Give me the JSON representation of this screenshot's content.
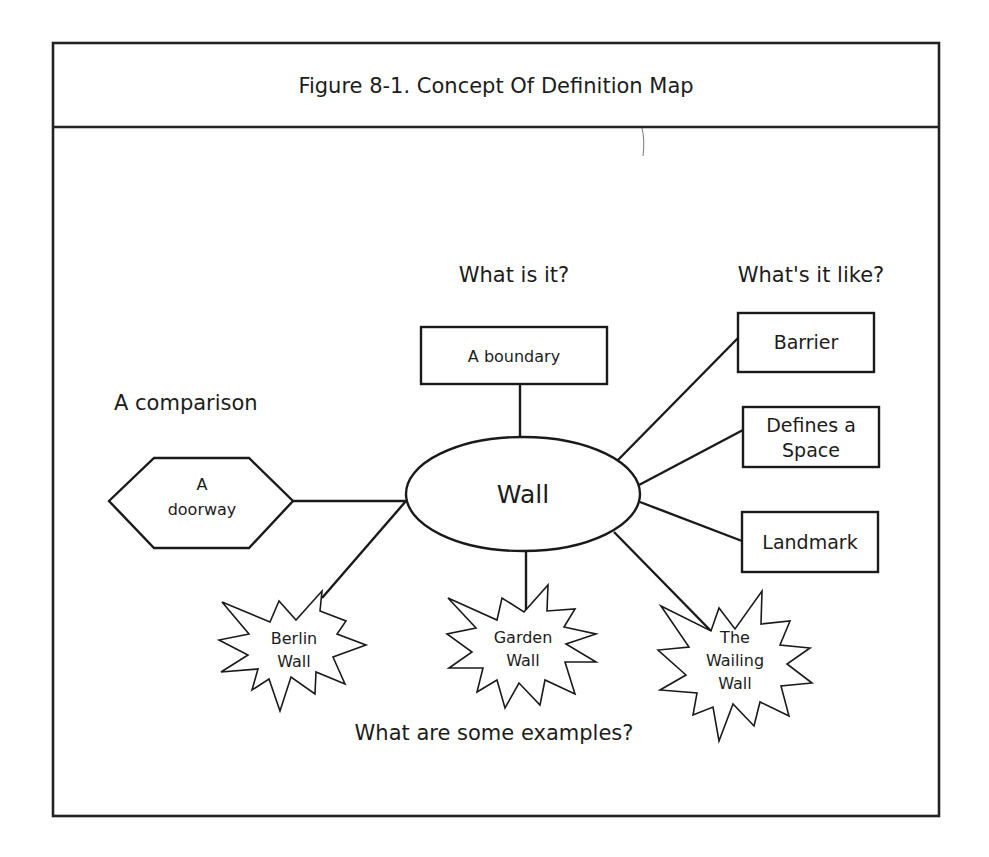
{
  "figure": {
    "title": "Figure 8-1. Concept Of Definition Map"
  },
  "colors": {
    "stroke": "#1a1a1a",
    "background": "#ffffff",
    "text": "#1c1c1c"
  },
  "concept": {
    "label": "Wall"
  },
  "questions": {
    "what_is_it": "What is it?",
    "whats_it_like": "What's it like?",
    "comparison": "A comparison",
    "examples": "What are some examples?"
  },
  "definition": {
    "label": "A boundary"
  },
  "properties": [
    {
      "lines": [
        "Barrier"
      ]
    },
    {
      "lines": [
        "Defines a",
        "Space"
      ]
    },
    {
      "lines": [
        "Landmark"
      ]
    }
  ],
  "comparison": {
    "lines": [
      "A",
      "doorway"
    ]
  },
  "examples": [
    {
      "lines": [
        "Berlin",
        "Wall"
      ]
    },
    {
      "lines": [
        "Garden",
        "Wall"
      ]
    },
    {
      "lines": [
        "The",
        "Wailing",
        "Wall"
      ]
    }
  ]
}
